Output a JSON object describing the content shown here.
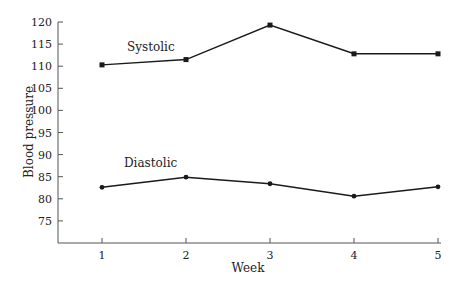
{
  "chart_data": {
    "type": "line",
    "title": "",
    "xlabel": "Week",
    "ylabel": "Blood pressure",
    "categories": [
      1,
      2,
      3,
      4,
      5
    ],
    "x_ticks": [
      "1",
      "2",
      "3",
      "4",
      "5"
    ],
    "y_ticks": [
      "75",
      "80",
      "85",
      "90",
      "95",
      "100",
      "105",
      "110",
      "115",
      "120"
    ],
    "ylim": [
      70,
      120
    ],
    "grid": false,
    "legend": "none (series labeled inline)",
    "series": [
      {
        "name": "Systolic",
        "marker": "square",
        "values": [
          110.3,
          111.5,
          119.3,
          112.8,
          112.8
        ]
      },
      {
        "name": "Diastolic",
        "marker": "circle",
        "values": [
          82.6,
          84.9,
          83.4,
          80.6,
          82.7
        ]
      }
    ],
    "annotations": [
      {
        "text": "Systolic",
        "near": "systolic series, between weeks 1 and 2"
      },
      {
        "text": "Diastolic",
        "near": "diastolic series, between weeks 1 and 2"
      }
    ],
    "colors": {
      "line": "#1a1a1a",
      "axis": "#555555",
      "text": "#222222"
    }
  }
}
